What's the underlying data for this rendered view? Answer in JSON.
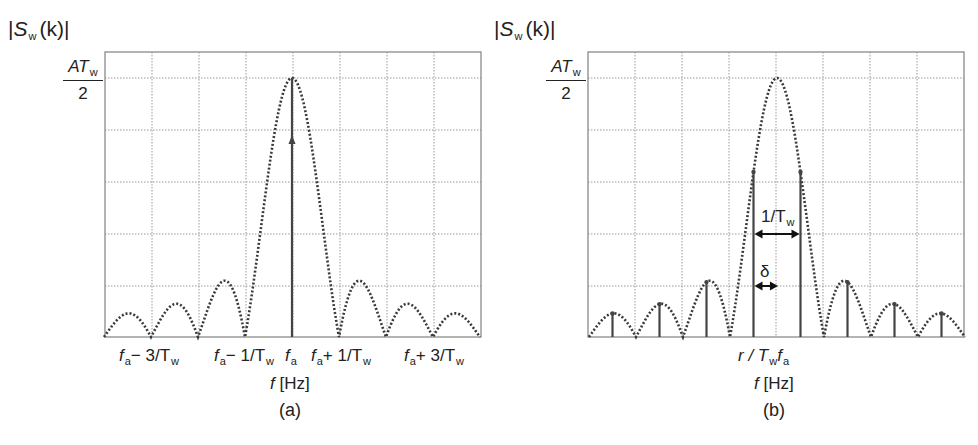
{
  "figure": {
    "panels": [
      {
        "id": "a",
        "caption": "(a)",
        "y_axis_label": {
          "symbol": "S",
          "subscript": "w",
          "arg": "(k)"
        },
        "y_tick": {
          "numerator": "AT",
          "numerator_sub": "w",
          "denominator": "2"
        },
        "x_axis_title": {
          "symbol": "f",
          "unit": "[Hz]"
        },
        "x_ticks": [
          {
            "base": "f",
            "sub": "a",
            "rest": "− 3/T",
            "rest_sub": "w"
          },
          {
            "base": "f",
            "sub": "a",
            "rest": "− 1/T",
            "rest_sub": "w"
          },
          {
            "base": "f",
            "sub": "a",
            "rest": "",
            "rest_sub": ""
          },
          {
            "base": "f",
            "sub": "a",
            "rest": "+ 1/T",
            "rest_sub": "w"
          },
          {
            "base": "f",
            "sub": "a",
            "rest": "+ 3/T",
            "rest_sub": "w"
          }
        ],
        "annotations": []
      },
      {
        "id": "b",
        "caption": "(b)",
        "y_axis_label": {
          "symbol": "S",
          "subscript": "w",
          "arg": "(k)"
        },
        "y_tick": {
          "numerator": "AT",
          "numerator_sub": "w",
          "denominator": "2"
        },
        "x_axis_title": {
          "symbol": "f",
          "unit": "[Hz]"
        },
        "x_ticks": [
          {
            "base": "r / T",
            "sub": "w",
            "rest": "f",
            "rest_sub": "a"
          }
        ],
        "annotations": [
          {
            "label": "1/T",
            "label_sub": "w",
            "meaning": "bin spacing"
          },
          {
            "label": "δ",
            "label_sub": "",
            "meaning": "offset between nearest bin and tone frequency"
          }
        ]
      }
    ]
  },
  "chart_data": [
    {
      "type": "line",
      "title": "(a) Spectrum of windowed sinusoid, frequency on bin grid",
      "xlabel": "f [Hz]",
      "ylabel": "|S_w(k)|",
      "x_units": "offset from f_a in multiples of 1/T_w",
      "xlim": [
        -4,
        4
      ],
      "ylim": [
        0,
        1.0
      ],
      "y_top_label": "AT_w/2",
      "grid": true,
      "curve": "|sin(pi x)/(pi x)| (dotted envelope)",
      "stems": [
        {
          "x": 0,
          "y": 1.0,
          "arrow": true
        }
      ],
      "tick_labels": [
        "f_a-3/T_w",
        "f_a-1/T_w",
        "f_a",
        "f_a+1/T_w",
        "f_a+3/T_w"
      ],
      "tick_positions": [
        -3,
        -1,
        0,
        1,
        3
      ]
    },
    {
      "type": "line",
      "title": "(b) Spectrum of windowed sinusoid, frequency between bins (leakage)",
      "xlabel": "f [Hz]",
      "ylabel": "|S_w(k)|",
      "x_units": "offset from f_a in multiples of 1/T_w",
      "xlim": [
        -4,
        4
      ],
      "ylim": [
        0,
        1.0
      ],
      "y_top_label": "AT_w/2",
      "grid": true,
      "curve": "|sin(pi x)/(pi x)| (dotted envelope)",
      "stems": [
        {
          "x": -3.5,
          "y": 0.091
        },
        {
          "x": -2.5,
          "y": 0.127
        },
        {
          "x": -1.5,
          "y": 0.212
        },
        {
          "x": -0.5,
          "y": 0.637
        },
        {
          "x": 0.5,
          "y": 0.637
        },
        {
          "x": 1.5,
          "y": 0.212
        },
        {
          "x": 2.5,
          "y": 0.127
        },
        {
          "x": 3.5,
          "y": 0.091
        }
      ],
      "tick_labels": [
        "r/T_w f_a"
      ],
      "tick_positions": [
        0
      ],
      "annotations": [
        "1/T_w (spacing between adjacent stems)",
        "δ (offset between f_a and nearest bin)"
      ]
    }
  ],
  "layout": {
    "frames": [
      {
        "x0": 105,
        "x1": 481,
        "y_top": 52,
        "y_peak": 78,
        "y_base": 337,
        "center": 292
      },
      {
        "x0": 588,
        "x1": 964,
        "y_top": 52,
        "y_peak": 78,
        "y_base": 337,
        "center": 777
      }
    ],
    "cell_px": 47,
    "hgrid": [
      78,
      130,
      182,
      234,
      286
    ],
    "colors": {
      "curve": "#3a3a3a",
      "grid": "#9a9a9a",
      "frame": "#8a8a8a",
      "stem": "#444444"
    }
  }
}
